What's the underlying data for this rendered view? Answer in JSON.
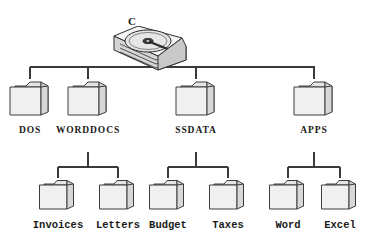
{
  "diagram": {
    "type": "hierarchy-tree",
    "line_color": "#3a3a3a",
    "folder_face_color": "#efefef",
    "folder_side_color": "#d8d8d8",
    "folder_outline_color": "#3c3c3c",
    "background": "#ffffff"
  },
  "root": {
    "label": "C",
    "icon": "hard-disk-drive-icon"
  },
  "level1": [
    {
      "label": "DOS",
      "icon": "folder-icon",
      "x": 30,
      "has_children": false
    },
    {
      "label": "WORDDOCS",
      "icon": "folder-icon",
      "x": 88,
      "has_children": true
    },
    {
      "label": "SSDATA",
      "icon": "folder-icon",
      "x": 196,
      "has_children": true
    },
    {
      "label": "APPS",
      "icon": "folder-icon",
      "x": 314,
      "has_children": true
    }
  ],
  "level2": [
    {
      "parent": "WORDDOCS",
      "stem_x": 88,
      "children": [
        {
          "label": "Invoices",
          "icon": "folder-icon",
          "x": 58
        },
        {
          "label": "Letters",
          "icon": "folder-icon",
          "x": 118
        }
      ]
    },
    {
      "parent": "SSDATA",
      "stem_x": 196,
      "children": [
        {
          "label": "Budget",
          "icon": "folder-icon",
          "x": 168
        },
        {
          "label": "Taxes",
          "icon": "folder-icon",
          "x": 228
        }
      ]
    },
    {
      "parent": "APPS",
      "stem_x": 314,
      "children": [
        {
          "label": "Word",
          "icon": "folder-icon",
          "x": 288
        },
        {
          "label": "Excel",
          "icon": "folder-icon",
          "x": 340
        }
      ]
    }
  ]
}
